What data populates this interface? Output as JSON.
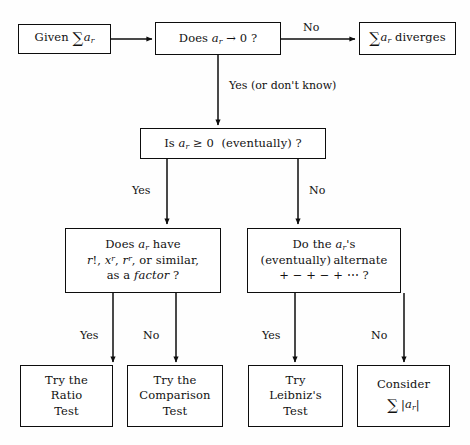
{
  "diagram": {
    "background_color": "#fefefe",
    "line_color": "#0d0d0d"
  },
  "nodes": {
    "given": {
      "name": "given-series",
      "text": "Given ∑ a_r"
    },
    "tends_zero": {
      "name": "does-a-r-tend-to-zero",
      "text": "Does a_r → 0 ?"
    },
    "diverges": {
      "name": "series-diverges",
      "text": "∑ a_r diverges"
    },
    "nonneg": {
      "name": "is-a-r-nonnegative",
      "text": "Is a_r ≥ 0  (eventually) ?"
    },
    "factor": {
      "name": "has-factorial-factor",
      "line1": "Does a_r have",
      "line2": "r!, x^r, r^r, or similar,",
      "line3": "as a factor ?"
    },
    "alternate": {
      "name": "does-alternate",
      "line1": "Do the a_r's",
      "line2": "(eventually) alternate",
      "line3": "+ − + − + ⋯ ?"
    },
    "ratio": {
      "name": "try-ratio-test",
      "line1": "Try the",
      "line2": "Ratio",
      "line3": "Test"
    },
    "comparison": {
      "name": "try-comparison-test",
      "line1": "Try the",
      "line2": "Comparison",
      "line3": "Test"
    },
    "leibniz": {
      "name": "try-leibniz-test",
      "line1": "Try",
      "line2": "Leibniz's",
      "line3": "Test"
    },
    "consider_abs": {
      "name": "consider-absolute-series",
      "line1": "Consider",
      "line2": "∑ |a_r|"
    }
  },
  "edge_labels": {
    "no_top": "No",
    "yes_dont_know": "Yes (or don't know)",
    "yes_nonneg": "Yes",
    "no_nonneg": "No",
    "yes_factor": "Yes",
    "no_factor": "No",
    "yes_alternate": "Yes",
    "no_alternate": "No"
  }
}
